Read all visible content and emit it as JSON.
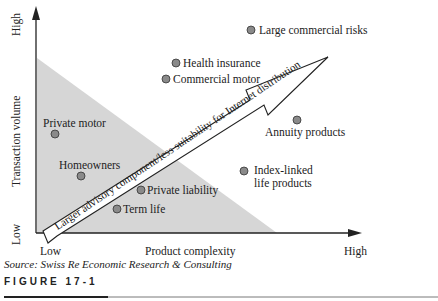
{
  "figure": {
    "source": "Source: Swiss Re Economic Research & Consulting",
    "label": "FIGURE 17-1"
  },
  "axes": {
    "y_title": "Transaction volume",
    "y_high": "High",
    "y_low": "Low",
    "x_title": "Product complexity",
    "x_low": "Low",
    "x_high": "High"
  },
  "arrow_label": "Larger advisory component/less suitability for Internet distribution",
  "points": [
    {
      "label": "Large commercial risks",
      "x": 251,
      "y": 30
    },
    {
      "label": "Health insurance",
      "x": 176,
      "y": 63
    },
    {
      "label": "Commercial motor",
      "x": 166,
      "y": 79
    },
    {
      "label": "Private motor",
      "x": 55,
      "y": 134
    },
    {
      "label": "Annuity products",
      "x": 297,
      "y": 120
    },
    {
      "label": "Homeowners",
      "x": 81,
      "y": 176
    },
    {
      "label": "Index-linked life products",
      "x": 244,
      "y": 171
    },
    {
      "label": "Private liability",
      "x": 141,
      "y": 190
    },
    {
      "label": "Term life",
      "x": 117,
      "y": 209
    }
  ],
  "colors": {
    "shade": "#d4d4d4",
    "point": "#8a8a8a",
    "axis": "#222222"
  }
}
